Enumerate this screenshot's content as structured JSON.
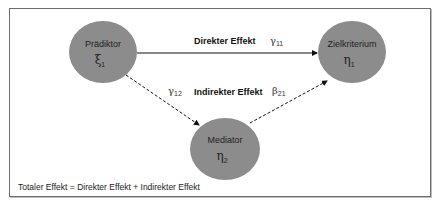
{
  "nodes": {
    "predictor": {
      "label": "Prädiktor",
      "symbol": "ξ",
      "subscript": "1",
      "fill": "#8c8c8c"
    },
    "criterion": {
      "label": "Zielkriterium",
      "symbol": "η",
      "subscript": "1",
      "fill": "#8c8c8c"
    },
    "mediator": {
      "label": "Mediator",
      "symbol": "η",
      "subscript": "2",
      "fill": "#8c8c8c"
    }
  },
  "edges": {
    "direct": {
      "label": "Direkter Effekt",
      "coef_symbol": "γ",
      "coef_subscript": "11",
      "style": "solid"
    },
    "indirect": {
      "label": "Indirekter Effekt"
    },
    "pred_to_med": {
      "coef_symbol": "γ",
      "coef_subscript": "12",
      "style": "dashed"
    },
    "med_to_crit": {
      "coef_symbol": "β",
      "coef_subscript": "21",
      "style": "dashed"
    }
  },
  "footer": {
    "text": "Totaler Effekt = Direkter Effekt + Indirekter Effekt"
  }
}
